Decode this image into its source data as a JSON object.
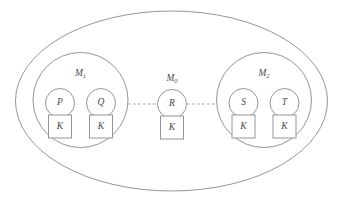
{
  "figure": {
    "background_color": "#ffffff",
    "stroke_color": "#8a8a8a",
    "dashed_link_color": "#9a9a9a",
    "text_color": "#4a4a4a"
  },
  "boundary": {
    "name": "system-boundary",
    "shape": "ellipse",
    "cx": 171.5,
    "cy": 101,
    "rx": 156,
    "ry": 90
  },
  "modules": [
    {
      "id": "m1",
      "label": "M",
      "subscript": "1",
      "cx": 80.5,
      "cy": 100,
      "r": 47.5,
      "label_x": 80.5,
      "label_y": 74,
      "nodes": [
        {
          "id": "p",
          "label": "P",
          "cx": 60,
          "cy": 103,
          "r": 14.5,
          "key": {
            "label": "K",
            "x": 48.5,
            "y": 115,
            "w": 23,
            "h": 23
          }
        },
        {
          "id": "q",
          "label": "Q",
          "cx": 101,
          "cy": 103,
          "r": 14.5,
          "key": {
            "label": "K",
            "x": 89.5,
            "y": 115,
            "w": 23,
            "h": 23
          }
        }
      ]
    },
    {
      "id": "m0",
      "label": "M",
      "subscript": "0",
      "cx": 172,
      "cy": 104,
      "r": 0,
      "label_x": 172,
      "label_y": 79,
      "nodes": [
        {
          "id": "r",
          "label": "R",
          "cx": 172,
          "cy": 104,
          "r": 14.5,
          "key": {
            "label": "K",
            "x": 160.5,
            "y": 116,
            "w": 23,
            "h": 23
          }
        }
      ]
    },
    {
      "id": "m2",
      "label": "M",
      "subscript": "2",
      "cx": 264,
      "cy": 100,
      "r": 47.5,
      "label_x": 264,
      "label_y": 74,
      "nodes": [
        {
          "id": "s",
          "label": "S",
          "cx": 243.5,
          "cy": 103,
          "r": 14.5,
          "key": {
            "label": "K",
            "x": 232,
            "y": 115,
            "w": 23,
            "h": 23
          }
        },
        {
          "id": "t",
          "label": "T",
          "cx": 284.5,
          "cy": 103,
          "r": 14.5,
          "key": {
            "label": "K",
            "x": 273,
            "y": 115,
            "w": 23,
            "h": 23
          }
        }
      ]
    }
  ],
  "links": [
    {
      "id": "link-m1-r",
      "from": "m1",
      "to": "r",
      "style": "dashed",
      "x1": 128,
      "y1": 104,
      "x2": 157,
      "y2": 104
    },
    {
      "id": "link-r-m2",
      "from": "r",
      "to": "m2",
      "style": "dashed",
      "x1": 187,
      "y1": 104,
      "x2": 216.5,
      "y2": 104
    }
  ]
}
